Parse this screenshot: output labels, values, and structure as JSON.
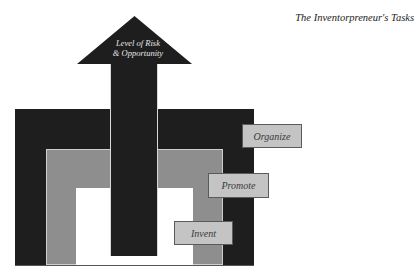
{
  "title": "The Inventorpreneur's Tasks",
  "arrow": {
    "line1": "Level of Risk",
    "line2": "& Opportunity"
  },
  "labels": [
    {
      "text": "Organize",
      "level": "outer"
    },
    {
      "text": "Promote",
      "level": "middle"
    },
    {
      "text": "Invent",
      "level": "inner"
    }
  ],
  "colors": {
    "outer": "#1e1e1e",
    "middle": "#8e8e8e",
    "inner": "#ffffff",
    "label_bg": "#c4c4c4",
    "arrow": "#1e1e1e"
  }
}
